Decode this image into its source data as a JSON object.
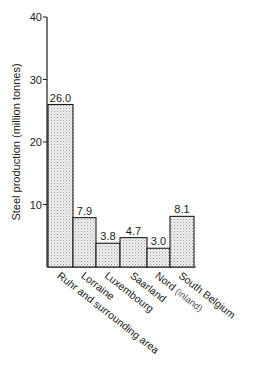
{
  "chart_data": {
    "type": "bar",
    "title": "",
    "xlabel": "",
    "ylabel": "Steel production (million tonnes)",
    "ylim": [
      0,
      40
    ],
    "yticks": [
      10,
      20,
      30,
      40
    ],
    "grid": false,
    "legend": null,
    "bar_fill": "stippled light grey",
    "categories": [
      "Ruhr and surrounding area",
      "Lorraine",
      "Luxembourg",
      "Saarland",
      "Nord (inland)",
      "South Belgium"
    ],
    "values": [
      26.0,
      7.9,
      3.8,
      4.7,
      3.0,
      8.1
    ],
    "value_labels": [
      "26.0",
      "7.9",
      "3.8",
      "4.7",
      "3.0",
      "8.1"
    ],
    "category_display": [
      {
        "main": "Ruhr and surrounding area",
        "sub": ""
      },
      {
        "main": "Lorraine",
        "sub": ""
      },
      {
        "main": "Luxembourg",
        "sub": ""
      },
      {
        "main": "Saarland",
        "sub": ""
      },
      {
        "main": "Nord",
        "sub": "(inland)"
      },
      {
        "main": "South Belgium",
        "sub": ""
      }
    ]
  }
}
